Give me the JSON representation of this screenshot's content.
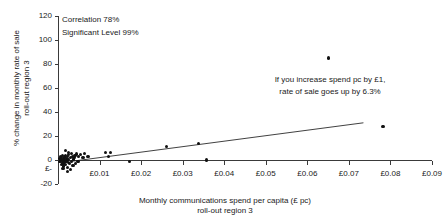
{
  "chart_data": {
    "type": "scatter",
    "title": "",
    "xlabel": "Monthly communications spend per capita (£ pc)\nroll-out region 3",
    "xlabel_line1": "Monthly communications spend per capita (£ pc)",
    "xlabel_line2": "roll-out region 3",
    "ylabel_line1": "% change in monthly rate of sale",
    "ylabel_line2": "roll-out region 3",
    "xlim": [
      0,
      0.09
    ],
    "ylim": [
      -20,
      120
    ],
    "xticks": [
      0.01,
      0.02,
      0.03,
      0.04,
      0.05,
      0.06,
      0.07,
      0.08,
      0.09
    ],
    "xtick_labels": [
      "£0.01",
      "£0.02",
      "£0.03",
      "£0.04",
      "£0.05",
      "£0.06",
      "£0.07",
      "£0.08",
      "£0.09"
    ],
    "yticks": [
      -20,
      0,
      20,
      40,
      60,
      80,
      100,
      120
    ],
    "ytick_labels": [
      "-20",
      "0",
      "20",
      "40",
      "60",
      "80",
      "100",
      "120"
    ],
    "extra_ytick_label": "£-",
    "grid": false,
    "legend": false,
    "marker_color": "#111111",
    "axis_color": "#3a3a3a",
    "trendline": {
      "x0": 0.0035,
      "y0": -1.0,
      "x1": 0.0735,
      "y1": 31.0,
      "slope_percent_per_pound": 6.3
    },
    "annotations": [
      {
        "name": "correlation",
        "text": "Correlation 78%"
      },
      {
        "name": "significance",
        "text": "Significant Level 99%"
      },
      {
        "name": "slope-line-1",
        "text": "If you increase spend pc by £1,"
      },
      {
        "name": "slope-line-2",
        "text": "rate of sale goes up by 6.3%"
      }
    ],
    "points": [
      {
        "x": 0.0004,
        "y": 1.5
      },
      {
        "x": 0.0005,
        "y": -1.0
      },
      {
        "x": 0.0006,
        "y": 3.0
      },
      {
        "x": 0.0007,
        "y": 0.5
      },
      {
        "x": 0.0008,
        "y": -3.5
      },
      {
        "x": 0.0009,
        "y": 2.0
      },
      {
        "x": 0.001,
        "y": -0.5
      },
      {
        "x": 0.0011,
        "y": 4.0
      },
      {
        "x": 0.0012,
        "y": -2.5
      },
      {
        "x": 0.0013,
        "y": 1.0
      },
      {
        "x": 0.0014,
        "y": -5.0
      },
      {
        "x": 0.0015,
        "y": 2.5
      },
      {
        "x": 0.0016,
        "y": 0.0
      },
      {
        "x": 0.0017,
        "y": -1.5
      },
      {
        "x": 0.0018,
        "y": 3.5
      },
      {
        "x": 0.0019,
        "y": -4.0
      },
      {
        "x": 0.002,
        "y": 1.2
      },
      {
        "x": 0.0021,
        "y": -0.8
      },
      {
        "x": 0.0022,
        "y": 2.8
      },
      {
        "x": 0.0023,
        "y": -6.0
      },
      {
        "x": 0.0024,
        "y": 0.3
      },
      {
        "x": 0.0025,
        "y": -2.0
      },
      {
        "x": 0.0026,
        "y": 4.5
      },
      {
        "x": 0.0028,
        "y": -3.0
      },
      {
        "x": 0.003,
        "y": 1.8
      },
      {
        "x": 0.0032,
        "y": -1.2
      },
      {
        "x": 0.0034,
        "y": 3.2
      },
      {
        "x": 0.0036,
        "y": -4.5
      },
      {
        "x": 0.0038,
        "y": 0.8
      },
      {
        "x": 0.004,
        "y": 2.2
      },
      {
        "x": 0.0042,
        "y": -2.8
      },
      {
        "x": 0.0045,
        "y": 5.0
      },
      {
        "x": 0.0048,
        "y": -1.0
      },
      {
        "x": 0.005,
        "y": 3.0
      },
      {
        "x": 0.0018,
        "y": 8.0
      },
      {
        "x": 0.0026,
        "y": 6.5
      },
      {
        "x": 0.0033,
        "y": 5.5
      },
      {
        "x": 0.0041,
        "y": 4.0
      },
      {
        "x": 0.0055,
        "y": 4.5
      },
      {
        "x": 0.006,
        "y": 2.0
      },
      {
        "x": 0.0064,
        "y": 5.5
      },
      {
        "x": 0.0072,
        "y": 3.0
      },
      {
        "x": 0.003,
        "y": -8.0
      },
      {
        "x": 0.0022,
        "y": -9.5
      },
      {
        "x": 0.0012,
        "y": -7.0
      },
      {
        "x": 0.0115,
        "y": 6.0
      },
      {
        "x": 0.0126,
        "y": 6.5
      },
      {
        "x": 0.0122,
        "y": 3.0
      },
      {
        "x": 0.0172,
        "y": -1.0
      },
      {
        "x": 0.0262,
        "y": 11.0
      },
      {
        "x": 0.0338,
        "y": 14.0
      },
      {
        "x": 0.0358,
        "y": 0.0
      },
      {
        "x": 0.065,
        "y": 85.0
      },
      {
        "x": 0.0782,
        "y": 28.0
      }
    ]
  }
}
